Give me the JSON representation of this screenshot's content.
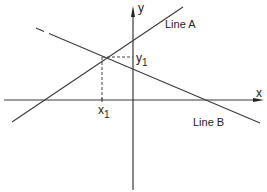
{
  "diagram": {
    "axes": {
      "x_label": "x",
      "y_label": "y"
    },
    "lines": [
      {
        "name": "Line A",
        "label": "Line A",
        "from": [
          12,
          122
        ],
        "to": [
          183,
          7
        ]
      },
      {
        "name": "Line B",
        "label": "Line B",
        "from": [
          36,
          28
        ],
        "to": [
          260,
          123
        ]
      }
    ],
    "intersection": {
      "x_label": "x",
      "x_sub": "1",
      "y_label": "y",
      "y_sub": "1",
      "point": [
        102,
        57
      ]
    },
    "colors": {
      "stroke": "#3a3a3a",
      "text": "#222222",
      "background": "#ffffff"
    }
  }
}
